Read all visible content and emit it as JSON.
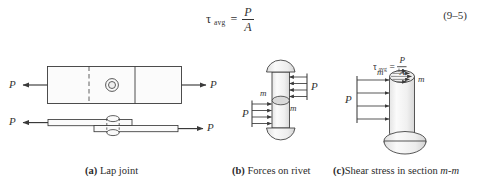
{
  "figure": {
    "background_color": "#ffffff",
    "line_color": "#3a3a3a",
    "fill_color": "#f2f2f2"
  },
  "equation": {
    "tau": "τ",
    "subscript": "avg",
    "equals": "=",
    "numerator": "P",
    "denominator": "A",
    "number": "(9–5)"
  },
  "panels": {
    "a": {
      "caption_tag": "(a)",
      "caption_text": "Lap joint",
      "left_force_label": "P",
      "right_force_label": "P",
      "side_left_force_label": "P",
      "side_right_force_label": "P"
    },
    "b": {
      "caption_tag": "(b)",
      "caption_text": "Forces on rivet",
      "left_force_label": "P",
      "right_force_label": "P",
      "section_label_upper": "m",
      "section_label_lower": "m"
    },
    "c": {
      "caption_tag": "(c)",
      "caption_text": "Shear stress in section ",
      "caption_italic": "m-m",
      "force_label": "P",
      "section_label_left": "m",
      "section_label_right": "m",
      "tau": "τ",
      "subscript": "avg",
      "equals": "=",
      "numerator": "P",
      "denominator": "A"
    }
  }
}
